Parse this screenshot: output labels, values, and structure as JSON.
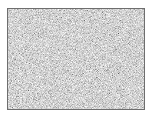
{
  "image": {
    "description": "gray noise texture",
    "icon": "noise-texture",
    "border_color": "#6e6e6e",
    "base_color": "#a8a8a8"
  }
}
